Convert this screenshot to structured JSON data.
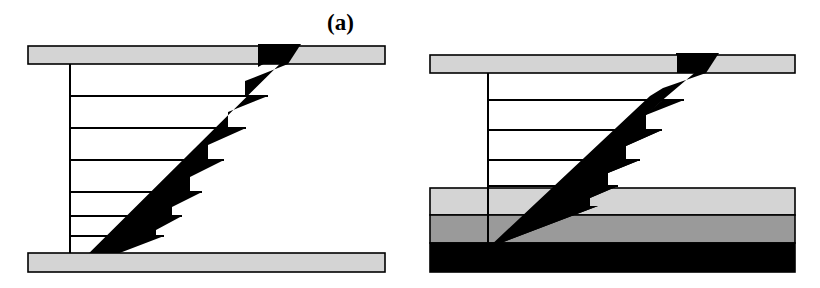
{
  "figure": {
    "background_color": "#ffffff",
    "width": 820,
    "height": 288
  },
  "colors": {
    "outline": "#000000",
    "arrow_fill": "#000000",
    "plate_light_gray": "#d4d4d4",
    "layer_light_gray": "#d4d4d4",
    "layer_medium_gray": "#9a9a9a",
    "layer_black": "#000000",
    "profile_line": "#000000",
    "white": "#ffffff"
  },
  "panels": [
    {
      "id": "a",
      "label": "(a)",
      "label_x": 327,
      "label_y": 11,
      "description": "Linear shear velocity profile between two rigid plates",
      "top_plate": {
        "x": 28,
        "y": 46,
        "width": 357,
        "height": 18,
        "fill": "#d4d4d4"
      },
      "bottom_plate": {
        "x": 28,
        "y": 253,
        "width": 357,
        "height": 19,
        "fill": "#d4d4d4"
      },
      "axis_line": {
        "x": 70,
        "y_top": 64,
        "y_bottom": 272
      },
      "wedge": {
        "apex_x": 70,
        "apex_y": 272,
        "tip_x": 300,
        "tip_y": 44,
        "steps": 7
      },
      "profile_lines": [
        {
          "y": 96,
          "x_start": 70,
          "x_end": 262
        },
        {
          "y": 128,
          "x_start": 70,
          "x_end": 228
        },
        {
          "y": 160,
          "x_start": 70,
          "x_end": 192
        },
        {
          "y": 192,
          "x_start": 70,
          "x_end": 155
        },
        {
          "y": 216,
          "x_start": 70,
          "x_end": 124
        },
        {
          "y": 236,
          "x_start": 70,
          "x_end": 100
        }
      ]
    },
    {
      "id": "b",
      "label": "(b)",
      "label_x": 752,
      "label_y": 11,
      "description": "Shear velocity profile over a three-layer compliant substrate",
      "top_plate": {
        "x": 20,
        "y": 55,
        "width": 365,
        "height": 18,
        "fill": "#d4d4d4"
      },
      "substrate_layers": [
        {
          "name": "upper-light-layer",
          "x": 20,
          "y": 188,
          "width": 365,
          "height": 27,
          "fill": "#d4d4d4"
        },
        {
          "name": "middle-gray-layer",
          "x": 20,
          "y": 215,
          "width": 365,
          "height": 28,
          "fill": "#9a9a9a"
        },
        {
          "name": "lower-black-layer",
          "x": 20,
          "y": 243,
          "width": 365,
          "height": 29,
          "fill": "#000000"
        }
      ],
      "axis_line": {
        "x": 78,
        "y_top": 73,
        "y_bottom": 248
      },
      "wedge": {
        "apex_x": 78,
        "apex_y": 248,
        "tip_x": 308,
        "tip_y": 53,
        "steps": 7
      },
      "profile_lines": [
        {
          "y": 100,
          "x_start": 78,
          "x_end": 268
        },
        {
          "y": 130,
          "x_start": 78,
          "x_end": 232
        },
        {
          "y": 160,
          "x_start": 78,
          "x_end": 196
        },
        {
          "y": 186,
          "x_start": 78,
          "x_end": 160
        },
        {
          "y": 206,
          "x_start": 78,
          "x_end": 130
        }
      ]
    }
  ]
}
